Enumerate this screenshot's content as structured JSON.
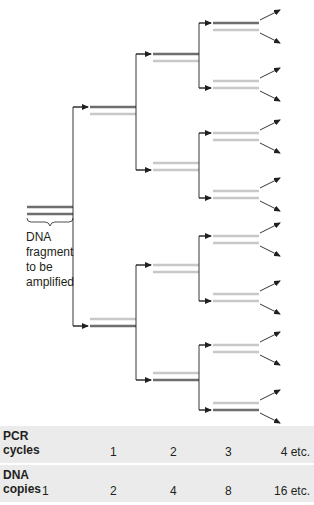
{
  "diagram": {
    "colors": {
      "original_strand": "#6e6e6e",
      "new_strand": "#c8c8c8",
      "connector": "#231f20",
      "table_bg": "#ebebeb"
    },
    "fragment_label": [
      "DNA",
      "fragment",
      "to be",
      "amplified"
    ],
    "generations": [
      {
        "cycle": 0,
        "pairs": [
          {
            "y": 207,
            "top": "original",
            "bottom": "original"
          }
        ]
      },
      {
        "cycle": 1,
        "pairs": [
          {
            "y": 107,
            "top": "original",
            "bottom": "new"
          },
          {
            "y": 319,
            "top": "new",
            "bottom": "original"
          }
        ]
      },
      {
        "cycle": 2,
        "pairs": [
          {
            "y": 54,
            "top": "original",
            "bottom": "new"
          },
          {
            "y": 163,
            "top": "new",
            "bottom": "new"
          },
          {
            "y": 265,
            "top": "new",
            "bottom": "new"
          },
          {
            "y": 373,
            "top": "new",
            "bottom": "original"
          }
        ]
      },
      {
        "cycle": 3,
        "pairs": [
          {
            "y": 23,
            "top": "original",
            "bottom": "new"
          },
          {
            "y": 81,
            "top": "new",
            "bottom": "new"
          },
          {
            "y": 133,
            "top": "new",
            "bottom": "new"
          },
          {
            "y": 191,
            "top": "new",
            "bottom": "new"
          },
          {
            "y": 236,
            "top": "new",
            "bottom": "new"
          },
          {
            "y": 294,
            "top": "new",
            "bottom": "new"
          },
          {
            "y": 345,
            "top": "new",
            "bottom": "new"
          },
          {
            "y": 403,
            "top": "new",
            "bottom": "original"
          }
        ]
      }
    ]
  },
  "table": {
    "cycles_row": {
      "label_line1": "PCR",
      "label_line2": "cycles",
      "values": [
        "1",
        "2",
        "3",
        "4 etc."
      ]
    },
    "copies_row": {
      "label_line1": "DNA",
      "label_line2": "copies",
      "values": [
        "1",
        "2",
        "4",
        "8",
        "16 etc."
      ]
    }
  }
}
